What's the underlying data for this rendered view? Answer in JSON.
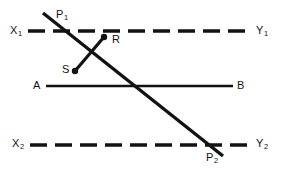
{
  "figure": {
    "width": 283,
    "height": 173,
    "background_color": "#ffffff",
    "stroke_color": "#121212"
  },
  "labels": {
    "x1": {
      "base": "X",
      "sub": "1",
      "x": 10,
      "y": 25
    },
    "y1": {
      "base": "Y",
      "sub": "1",
      "x": 256,
      "y": 25
    },
    "p1": {
      "base": "P",
      "sub": "1",
      "x": 56,
      "y": 9
    },
    "r": {
      "base": "R",
      "sub": "",
      "x": 112,
      "y": 34
    },
    "s": {
      "base": "S",
      "sub": "",
      "x": 62,
      "y": 64
    },
    "a": {
      "base": "A",
      "sub": "",
      "x": 33,
      "y": 80
    },
    "b": {
      "base": "B",
      "sub": "",
      "x": 237,
      "y": 80
    },
    "x2": {
      "base": "X",
      "sub": "2",
      "x": 12,
      "y": 138
    },
    "y2": {
      "base": "Y",
      "sub": "2",
      "x": 256,
      "y": 138
    },
    "p2": {
      "base": "P",
      "sub": "2",
      "x": 206,
      "y": 152
    }
  },
  "geometry": {
    "dashed_line_top": {
      "x1": 28,
      "y1": 31,
      "x2": 252,
      "y2": 31,
      "dash": "17 8",
      "width": 3.4
    },
    "dashed_line_bottom": {
      "x1": 30,
      "y1": 145,
      "x2": 252,
      "y2": 145,
      "dash": "17 8",
      "width": 3.4
    },
    "solid_line_ab": {
      "x1": 46,
      "y1": 86,
      "x2": 233,
      "y2": 86,
      "width": 2.6
    },
    "transversal_p1_p2": {
      "x1": 43,
      "y1": 13,
      "x2": 223,
      "y2": 156,
      "width": 3.4
    },
    "segment_rs": {
      "x1": 104,
      "y1": 37,
      "x2": 75,
      "y2": 71,
      "width": 3.2
    },
    "endpoint_r": {
      "cx": 104,
      "cy": 37,
      "r": 3.2
    },
    "endpoint_s": {
      "cx": 75,
      "cy": 71,
      "r": 3.2
    }
  }
}
